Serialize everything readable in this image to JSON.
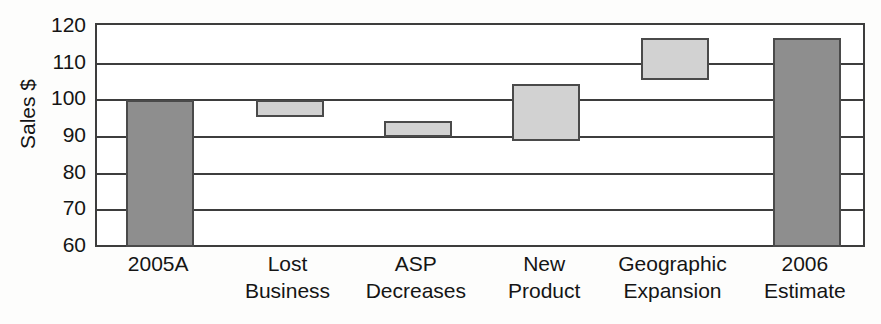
{
  "chart_data": {
    "type": "bar",
    "chart_subtype": "waterfall",
    "title": "",
    "xlabel": "",
    "ylabel": "Sales $",
    "ylim": [
      60,
      120
    ],
    "ytick_step": 10,
    "yticks": [
      120,
      110,
      100,
      90,
      80,
      70,
      60
    ],
    "grid": true,
    "legend": "none",
    "categories": [
      "2005A",
      "Lost\nBusiness",
      "ASP\nDecreases",
      "New\nProduct",
      "Geographic\nExpansion",
      "2006\nEstimate"
    ],
    "bars": [
      {
        "label": "2005A",
        "kind": "total",
        "base": 60.0,
        "top": 100.0,
        "value": 100.0,
        "color": "#8e8e8e"
      },
      {
        "label": "Lost Business",
        "kind": "decrease",
        "base": 95.5,
        "top": 100.0,
        "value": -4.5,
        "color": "#d2d2d2"
      },
      {
        "label": "ASP Decreases",
        "kind": "decrease",
        "base": 90.0,
        "top": 94.5,
        "value": -5.5,
        "color": "#d2d2d2"
      },
      {
        "label": "New Product",
        "kind": "increase",
        "base": 89.0,
        "top": 104.5,
        "value": 15.5,
        "color": "#d2d2d2"
      },
      {
        "label": "Geographic Expansion",
        "kind": "increase",
        "base": 105.5,
        "top": 117.0,
        "value": 11.5,
        "color": "#d2d2d2"
      },
      {
        "label": "2006 Estimate",
        "kind": "total",
        "base": 60.0,
        "top": 117.0,
        "value": 117.0,
        "color": "#8e8e8e"
      }
    ],
    "series": [
      {
        "name": "Sales $",
        "values": [
          100.0,
          -4.5,
          -5.5,
          15.5,
          11.5,
          117.0
        ]
      }
    ]
  },
  "axis": {
    "y_title": "Sales $",
    "y_tick_labels": [
      "120",
      "110",
      "100",
      "90",
      "80",
      "70",
      "60"
    ]
  },
  "x_axis": {
    "labels": [
      "2005A",
      "Lost\nBusiness",
      "ASP\nDecreases",
      "New\nProduct",
      "Geographic\nExpansion",
      "2006\nEstimate"
    ]
  },
  "style": {
    "bar_total_color": "#8e8e8e",
    "bar_step_color": "#d2d2d2",
    "bar_border_color": "#4a4a4a",
    "axis_color": "#3d3d3d",
    "background": "#fdfdfc",
    "text_color": "#151515"
  }
}
